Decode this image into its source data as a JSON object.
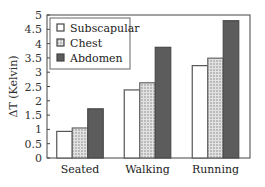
{
  "chart_data": {
    "type": "bar",
    "title": "",
    "xlabel": "",
    "ylabel": "ΔT (Kelvin)",
    "ylim": [
      0,
      5
    ],
    "yticks": [
      0,
      0.5,
      1,
      1.5,
      2,
      2.5,
      3,
      3.5,
      4,
      4.5,
      5
    ],
    "ytick_labels": [
      "0",
      "0.5",
      "1",
      "1.5",
      "2",
      "2.5",
      "3",
      "3.5",
      "4",
      "4.5",
      "5"
    ],
    "categories": [
      "Seated",
      "Walking",
      "Running"
    ],
    "series": [
      {
        "name": "Subscapular",
        "values": [
          0.93,
          2.38,
          3.23
        ],
        "fill": "#ffffff",
        "pattern": "none"
      },
      {
        "name": "Chest",
        "values": [
          1.05,
          2.63,
          3.49
        ],
        "fill": "#d4d4d4",
        "pattern": "dotted"
      },
      {
        "name": "Abdomen",
        "values": [
          1.72,
          3.87,
          4.8
        ],
        "fill": "#5a5a5a",
        "pattern": "solid-dark"
      }
    ],
    "legend_position": "upper-left-inside",
    "grid": false
  }
}
